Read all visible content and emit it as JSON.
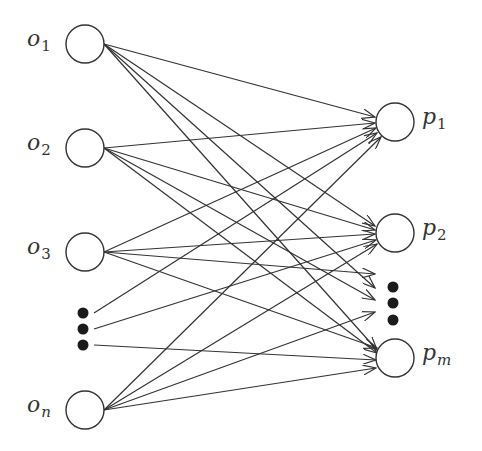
{
  "diagram": {
    "type": "bipartite-network",
    "colors": {
      "stroke": "#333333",
      "dot": "#1a1a1a",
      "background": "#ffffff"
    },
    "node_radius": 19,
    "inputs": [
      {
        "id": "o1",
        "base": "o",
        "sub": "1",
        "cx": 85,
        "cy": 44
      },
      {
        "id": "o2",
        "base": "o",
        "sub": "2",
        "cx": 85,
        "cy": 148
      },
      {
        "id": "o3",
        "base": "o",
        "sub": "3",
        "cx": 85,
        "cy": 252
      },
      {
        "id": "on",
        "base": "o",
        "sub": "n",
        "cx": 85,
        "cy": 410
      }
    ],
    "outputs": [
      {
        "id": "p1",
        "base": "p",
        "sub": "1",
        "cx": 395,
        "cy": 122
      },
      {
        "id": "p2",
        "base": "p",
        "sub": "2",
        "cx": 395,
        "cy": 233
      },
      {
        "id": "pm",
        "base": "p",
        "sub": "m",
        "cx": 395,
        "cy": 358
      }
    ],
    "left_ellipsis": [
      [
        83,
        313
      ],
      [
        83,
        329
      ],
      [
        83,
        345
      ]
    ],
    "right_ellipsis": [
      [
        393,
        287
      ],
      [
        393,
        303
      ],
      [
        393,
        320
      ]
    ],
    "edges": [
      {
        "from": [
          104,
          44
        ],
        "to": [
          375,
          117
        ]
      },
      {
        "from": [
          104,
          44
        ],
        "to": [
          375,
          226
        ]
      },
      {
        "from": [
          104,
          44
        ],
        "to": [
          375,
          288
        ]
      },
      {
        "from": [
          104,
          44
        ],
        "to": [
          377,
          350
        ]
      },
      {
        "from": [
          104,
          148
        ],
        "to": [
          375,
          123
        ]
      },
      {
        "from": [
          104,
          148
        ],
        "to": [
          375,
          230
        ]
      },
      {
        "from": [
          104,
          148
        ],
        "to": [
          375,
          300
        ]
      },
      {
        "from": [
          104,
          148
        ],
        "to": [
          377,
          353
        ]
      },
      {
        "from": [
          104,
          252
        ],
        "to": [
          376,
          128
        ]
      },
      {
        "from": [
          104,
          252
        ],
        "to": [
          375,
          234
        ]
      },
      {
        "from": [
          104,
          252
        ],
        "to": [
          375,
          274
        ]
      },
      {
        "from": [
          104,
          252
        ],
        "to": [
          377,
          348
        ]
      },
      {
        "from": [
          94,
          313
        ],
        "to": [
          377,
          133
        ]
      },
      {
        "from": [
          94,
          329
        ],
        "to": [
          376,
          240
        ]
      },
      {
        "from": [
          94,
          345
        ],
        "to": [
          376,
          360
        ]
      },
      {
        "from": [
          104,
          410
        ],
        "to": [
          381,
          137
        ]
      },
      {
        "from": [
          104,
          410
        ],
        "to": [
          377,
          244
        ]
      },
      {
        "from": [
          104,
          410
        ],
        "to": [
          375,
          312
        ]
      },
      {
        "from": [
          104,
          410
        ],
        "to": [
          376,
          368
        ]
      }
    ]
  }
}
